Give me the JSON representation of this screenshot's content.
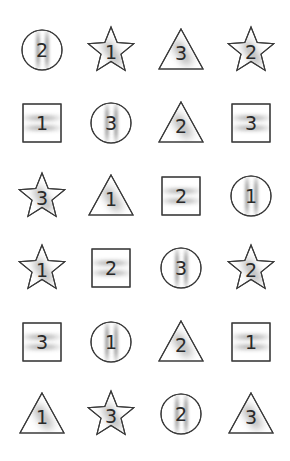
{
  "grid": {
    "columns": 4,
    "rows": 6,
    "col_centers": [
      42,
      111,
      181,
      251
    ],
    "row_centers": [
      50,
      123,
      196,
      268,
      342,
      414
    ],
    "stroke_color": "#3a3a3a",
    "shade_color": "#8a8a8a",
    "background": "#ffffff",
    "items": [
      {
        "shape": "circle",
        "number": "2",
        "shading": "vertical"
      },
      {
        "shape": "star",
        "number": "1",
        "shading": "diagonal"
      },
      {
        "shape": "triangle",
        "number": "3",
        "shading": "diagonal"
      },
      {
        "shape": "star",
        "number": "2",
        "shading": "diagonal"
      },
      {
        "shape": "square",
        "number": "1",
        "shading": "horizontal"
      },
      {
        "shape": "circle",
        "number": "3",
        "shading": "vertical"
      },
      {
        "shape": "triangle",
        "number": "2",
        "shading": "diagonal"
      },
      {
        "shape": "square",
        "number": "3",
        "shading": "horizontal"
      },
      {
        "shape": "star",
        "number": "3",
        "shading": "diagonal"
      },
      {
        "shape": "triangle",
        "number": "1",
        "shading": "diagonal"
      },
      {
        "shape": "square",
        "number": "2",
        "shading": "horizontal"
      },
      {
        "shape": "circle",
        "number": "1",
        "shading": "vertical"
      },
      {
        "shape": "star",
        "number": "1",
        "shading": "diagonal"
      },
      {
        "shape": "square",
        "number": "2",
        "shading": "horizontal"
      },
      {
        "shape": "circle",
        "number": "3",
        "shading": "vertical"
      },
      {
        "shape": "star",
        "number": "2",
        "shading": "diagonal"
      },
      {
        "shape": "square",
        "number": "3",
        "shading": "horizontal"
      },
      {
        "shape": "circle",
        "number": "1",
        "shading": "vertical"
      },
      {
        "shape": "triangle",
        "number": "2",
        "shading": "diagonal"
      },
      {
        "shape": "square",
        "number": "1",
        "shading": "horizontal"
      },
      {
        "shape": "triangle",
        "number": "1",
        "shading": "diagonal"
      },
      {
        "shape": "star",
        "number": "3",
        "shading": "diagonal"
      },
      {
        "shape": "circle",
        "number": "2",
        "shading": "vertical"
      },
      {
        "shape": "triangle",
        "number": "3",
        "shading": "diagonal"
      }
    ]
  }
}
